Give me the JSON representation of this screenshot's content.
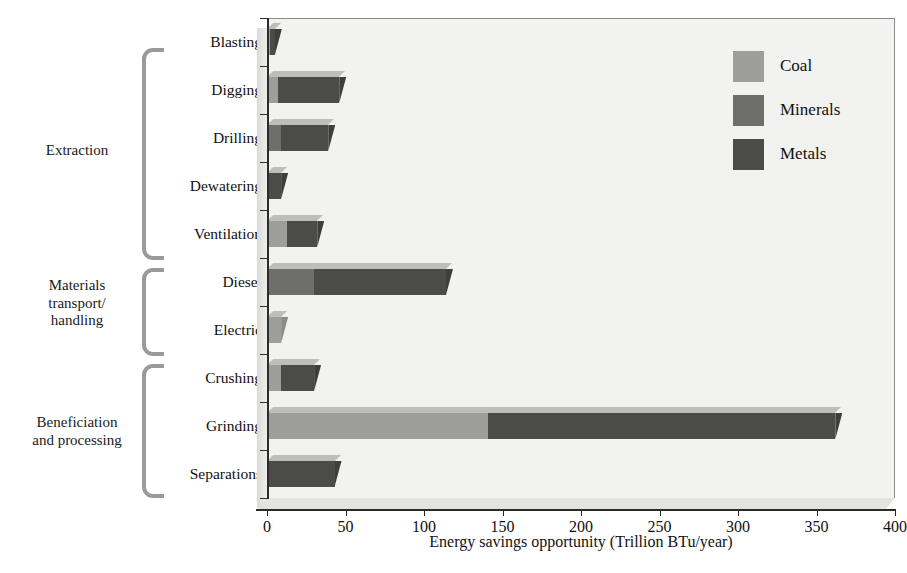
{
  "chart_data": {
    "type": "bar",
    "orientation": "horizontal",
    "stacked": true,
    "title": "",
    "xlabel": "Energy savings opportunity (Trillion BTu/year)",
    "ylabel": "",
    "xlim": [
      0,
      400
    ],
    "xticks": [
      0,
      50,
      100,
      150,
      200,
      250,
      300,
      350,
      400
    ],
    "xtick_labels": [
      "0",
      "50",
      "100",
      "150",
      "200",
      "250",
      "300",
      "350",
      "400"
    ],
    "grid": false,
    "legend_position": "top-right",
    "legend": [
      "Coal",
      "Minerals",
      "Metals"
    ],
    "series": [
      {
        "name": "Coal",
        "color": "#9d9d9b",
        "values": [
          2,
          7,
          0,
          0,
          13,
          0,
          9,
          9,
          141,
          0
        ]
      },
      {
        "name": "Minerals",
        "color": "#6e6e6d",
        "values": [
          0,
          0,
          9,
          0,
          0,
          30,
          0,
          0,
          0,
          0
        ]
      },
      {
        "name": "Metals",
        "color": "#4b4b4a",
        "values": [
          3,
          39,
          30,
          9,
          19,
          84,
          0,
          21,
          221,
          43
        ]
      }
    ],
    "categories": [
      "Blasting",
      "Digging",
      "Drilling",
      "Dewatering",
      "Ventilation",
      "Diesel",
      "Electric",
      "Crushing",
      "Grinding",
      "Separations"
    ],
    "totals": [
      5,
      46,
      39,
      9,
      32,
      114,
      9,
      30,
      362,
      43
    ],
    "groups": [
      {
        "label": "Extraction",
        "categories": [
          "Blasting",
          "Digging",
          "Drilling",
          "Dewatering",
          "Ventilation"
        ]
      },
      {
        "label": "Materials\ntransport/\nhandling",
        "categories": [
          "Diesel",
          "Electric"
        ]
      },
      {
        "label": "Beneficiation\nand processing",
        "categories": [
          "Crushing",
          "Grinding",
          "Separations"
        ]
      }
    ]
  },
  "legend": {
    "items": [
      {
        "label": "Coal",
        "color": "#9d9d9b"
      },
      {
        "label": "Minerals",
        "color": "#6e6e6d"
      },
      {
        "label": "Metals",
        "color": "#4b4b4a"
      }
    ]
  },
  "axis": {
    "x_title": "Energy savings opportunity (Trillion BTu/year)",
    "x_tick_labels": [
      "0",
      "50",
      "100",
      "150",
      "200",
      "250",
      "300",
      "350",
      "400"
    ]
  },
  "groups": {
    "extraction": "Extraction",
    "materials": "Materials\ntransport/\nhandling",
    "beneficiation": "Beneficiation\nand processing"
  }
}
